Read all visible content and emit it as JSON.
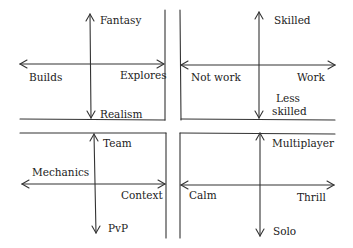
{
  "diagram": {
    "type": "four-quadrant-axes",
    "stroke_color": "#333333",
    "quadrants": [
      {
        "id": "top-left",
        "vertical_axis": {
          "top": "Fantasy",
          "bottom": "Realism"
        },
        "horizontal_axis": {
          "left": "Builds",
          "right": "Explores"
        }
      },
      {
        "id": "top-right",
        "vertical_axis": {
          "top": "Skilled",
          "bottom": "Less skilled",
          "bottom_line1": "Less",
          "bottom_line2": "skilled"
        },
        "horizontal_axis": {
          "left": "Not work",
          "right": "Work"
        }
      },
      {
        "id": "bottom-left",
        "vertical_axis": {
          "top": "Team",
          "bottom": "PvP"
        },
        "horizontal_axis": {
          "left": "Mechanics",
          "right": "Context"
        }
      },
      {
        "id": "bottom-right",
        "vertical_axis": {
          "top": "Multiplayer",
          "bottom": "Solo"
        },
        "horizontal_axis": {
          "left": "Calm",
          "right": "Thrill"
        }
      }
    ]
  }
}
